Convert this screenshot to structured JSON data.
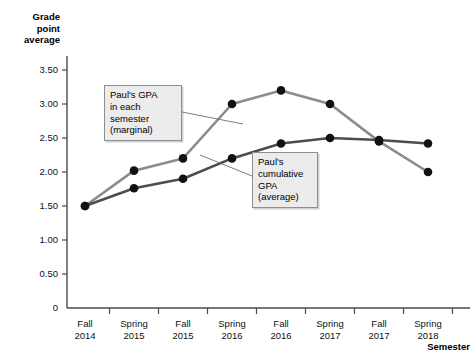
{
  "chart_data": {
    "type": "line",
    "title": "",
    "xlabel": "Semester",
    "ylabel": "Grade point average",
    "ylim": [
      0,
      3.5
    ],
    "yticks": [
      0,
      0.5,
      1.0,
      1.5,
      2.0,
      2.5,
      3.0,
      3.5
    ],
    "ytick_labels": [
      "0",
      "0.50",
      "1.00",
      "1.50",
      "2.00",
      "2.50",
      "3.00",
      "3.50"
    ],
    "grid": false,
    "legend_position": "annotations",
    "categories": [
      "Fall 2014",
      "Spring 2015",
      "Fall 2015",
      "Spring 2016",
      "Fall 2016",
      "Spring 2017",
      "Fall 2017",
      "Spring 2018"
    ],
    "xtick_labels": [
      {
        "line1": "Fall",
        "line2": "2014"
      },
      {
        "line1": "Spring",
        "line2": "2015"
      },
      {
        "line1": "Fall",
        "line2": "2015"
      },
      {
        "line1": "Spring",
        "line2": "2016"
      },
      {
        "line1": "Fall",
        "line2": "2016"
      },
      {
        "line1": "Spring",
        "line2": "2017"
      },
      {
        "line1": "Fall",
        "line2": "2017"
      },
      {
        "line1": "Spring",
        "line2": "2018"
      }
    ],
    "series": [
      {
        "name": "Paul's GPA in each semester (marginal)",
        "color": "#8c8c8c",
        "values": [
          1.5,
          2.02,
          2.2,
          3.0,
          3.2,
          3.0,
          2.45,
          2.0
        ]
      },
      {
        "name": "Paul's cumulative GPA (average)",
        "color": "#4d4d4d",
        "values": [
          1.5,
          1.76,
          1.9,
          2.2,
          2.42,
          2.5,
          2.47,
          2.42
        ]
      }
    ],
    "annotations": [
      {
        "id": "marginal",
        "lines": [
          "Paul's GPA",
          "in each",
          "semester",
          "(marginal)"
        ],
        "target_index": 3
      },
      {
        "id": "cumulative",
        "lines": [
          "Paul's",
          "cumulative",
          "GPA",
          "(average)"
        ],
        "target_index": 1
      }
    ],
    "axis_color": "#4a4a4a",
    "marker_color": "#111111"
  }
}
